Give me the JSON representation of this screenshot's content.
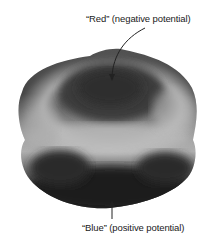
{
  "diagram": {
    "labels": {
      "top": "“Red” (negative potential)",
      "bottom": "“Blue” (positive potential)"
    },
    "colors": {
      "background": "#ffffff",
      "text": "#1a1a1a",
      "surface_dark": "#2a2a2a",
      "surface_light": "#c8c8c8",
      "arrow": "#222222"
    }
  }
}
